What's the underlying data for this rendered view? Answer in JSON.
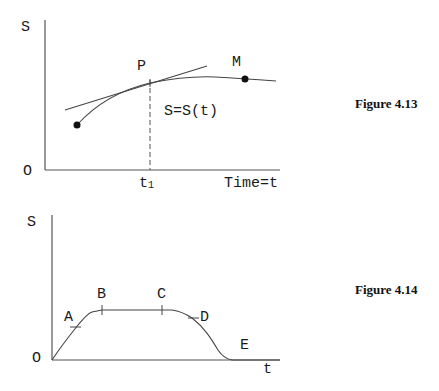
{
  "figures": [
    {
      "caption": "Figure 4.13",
      "y_axis_label": "S",
      "origin_label": "O",
      "x_axis_label": "Time=t",
      "point_p_label": "P",
      "point_m_label": "M",
      "function_label": "S=S(t)",
      "tick_label_main": "t",
      "tick_label_sub": "1"
    },
    {
      "caption": "Figure 4.14",
      "y_axis_label": "S",
      "origin_label": "O",
      "x_axis_label": "t",
      "points": [
        "A",
        "B",
        "C",
        "D",
        "E"
      ]
    }
  ]
}
